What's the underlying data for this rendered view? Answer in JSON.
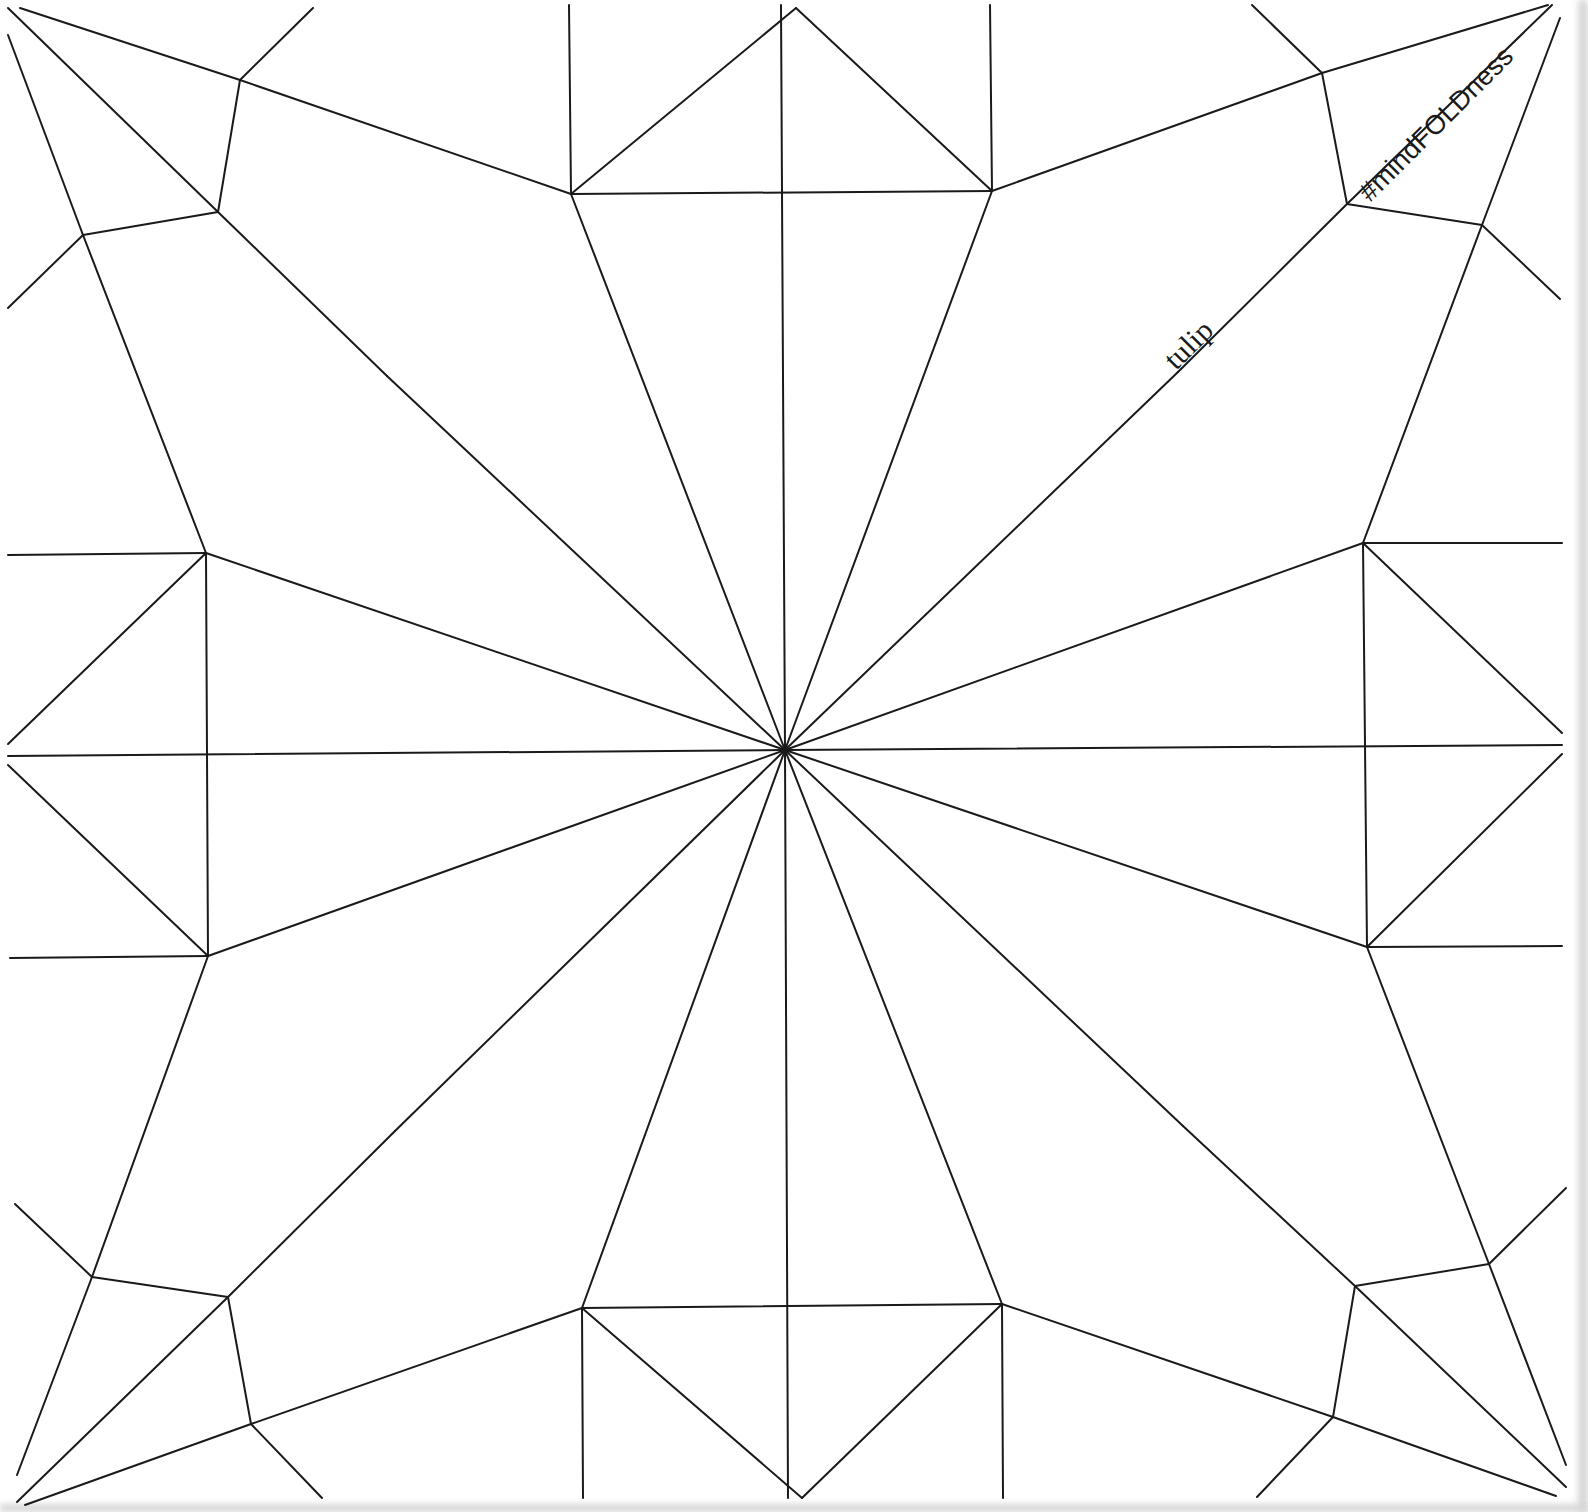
{
  "diagram": {
    "type": "origami-crease-pattern",
    "title": "tulip",
    "brand_tag": "#mindFOLDness",
    "line_color": "#1a1a1a",
    "background": "#ffffff",
    "center": [
      785,
      750
    ],
    "segments": [
      [
        785,
        750,
        781,
        5
      ],
      [
        785,
        750,
        788,
        1498
      ],
      [
        785,
        750,
        8,
        756
      ],
      [
        785,
        750,
        1562,
        745
      ],
      [
        785,
        750,
        571,
        194
      ],
      [
        785,
        750,
        992,
        191
      ],
      [
        785,
        750,
        206,
        553
      ],
      [
        785,
        750,
        1363,
        543
      ],
      [
        785,
        750,
        208,
        956
      ],
      [
        785,
        750,
        1367,
        947
      ],
      [
        785,
        750,
        582,
        1308
      ],
      [
        785,
        750,
        1002,
        1304
      ],
      [
        785,
        750,
        387,
        376
      ],
      [
        785,
        750,
        1178,
        372
      ],
      [
        785,
        750,
        395,
        1131
      ],
      [
        785,
        750,
        1183,
        1126
      ],
      [
        571,
        194,
        992,
        191
      ],
      [
        582,
        1308,
        1002,
        1304
      ],
      [
        206,
        553,
        208,
        956
      ],
      [
        1363,
        543,
        1367,
        947
      ],
      [
        571,
        194,
        569,
        5
      ],
      [
        992,
        191,
        990,
        5
      ],
      [
        582,
        1308,
        583,
        1498
      ],
      [
        1002,
        1304,
        1003,
        1498
      ],
      [
        206,
        553,
        8,
        555
      ],
      [
        208,
        956,
        10,
        958
      ],
      [
        1363,
        543,
        1562,
        543
      ],
      [
        1367,
        947,
        1562,
        946
      ],
      [
        571,
        194,
        796,
        8
      ],
      [
        992,
        191,
        796,
        8
      ],
      [
        582,
        1308,
        802,
        1498
      ],
      [
        1002,
        1304,
        802,
        1498
      ],
      [
        206,
        553,
        8,
        744
      ],
      [
        208,
        956,
        8,
        765
      ],
      [
        1363,
        543,
        1562,
        733
      ],
      [
        1367,
        947,
        1562,
        754
      ],
      [
        571,
        194,
        240,
        80
      ],
      [
        240,
        80,
        20,
        8
      ],
      [
        992,
        191,
        1322,
        73
      ],
      [
        1322,
        73,
        1548,
        5
      ],
      [
        582,
        1308,
        251,
        1424
      ],
      [
        251,
        1424,
        25,
        1505
      ],
      [
        1002,
        1304,
        1333,
        1417
      ],
      [
        1333,
        1417,
        1556,
        1496
      ],
      [
        206,
        553,
        83,
        235
      ],
      [
        83,
        235,
        8,
        35
      ],
      [
        1363,
        543,
        1482,
        225
      ],
      [
        1482,
        225,
        1560,
        18
      ],
      [
        208,
        956,
        92,
        1277
      ],
      [
        92,
        1277,
        17,
        1475
      ],
      [
        1367,
        947,
        1489,
        1264
      ],
      [
        1489,
        1264,
        1566,
        1465
      ],
      [
        387,
        376,
        218,
        212
      ],
      [
        218,
        212,
        8,
        8
      ],
      [
        1178,
        372,
        1347,
        204
      ],
      [
        1347,
        204,
        1552,
        5
      ],
      [
        395,
        1131,
        228,
        1297
      ],
      [
        228,
        1297,
        17,
        1502
      ],
      [
        1183,
        1126,
        1355,
        1286
      ],
      [
        1355,
        1286,
        1566,
        1487
      ],
      [
        218,
        212,
        240,
        80
      ],
      [
        218,
        212,
        83,
        235
      ],
      [
        1347,
        204,
        1322,
        73
      ],
      [
        1347,
        204,
        1482,
        225
      ],
      [
        228,
        1297,
        92,
        1277
      ],
      [
        228,
        1297,
        251,
        1424
      ],
      [
        1355,
        1286,
        1489,
        1264
      ],
      [
        1355,
        1286,
        1333,
        1417
      ],
      [
        240,
        80,
        313,
        8
      ],
      [
        83,
        235,
        8,
        308
      ],
      [
        1322,
        73,
        1252,
        5
      ],
      [
        1482,
        225,
        1560,
        299
      ],
      [
        92,
        1277,
        15,
        1204
      ],
      [
        251,
        1424,
        322,
        1498
      ],
      [
        1489,
        1264,
        1566,
        1188
      ],
      [
        1333,
        1417,
        1257,
        1497
      ]
    ]
  }
}
